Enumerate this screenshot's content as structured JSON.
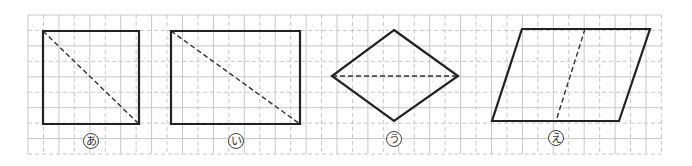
{
  "grid": {
    "x0": 28,
    "y0": 15,
    "cell": 15.45,
    "cols": 41,
    "rows": 9,
    "solid_color": "#c8c8c8",
    "dashed_color": "#c8c8c8",
    "pattern": "alternating solid/dashed, starting solid"
  },
  "style": {
    "shape_stroke": "#222222",
    "shape_width": 2.2,
    "dash_stroke": "#333333",
    "dash_width": 1.4,
    "label_circle": "#444444"
  },
  "figures": [
    {
      "id": "a",
      "name": "square",
      "label": "あ",
      "outline": [
        [
          43,
          31
        ],
        [
          139,
          31
        ],
        [
          139,
          124
        ],
        [
          43,
          124
        ]
      ],
      "dashed": [
        [
          43,
          31
        ],
        [
          139,
          124
        ]
      ],
      "label_pos": [
        91,
        141
      ]
    },
    {
      "id": "i",
      "name": "rectangle",
      "label": "い",
      "outline": [
        [
          171,
          31
        ],
        [
          300,
          31
        ],
        [
          300,
          124
        ],
        [
          171,
          124
        ]
      ],
      "dashed": [
        [
          171,
          31
        ],
        [
          300,
          124
        ]
      ],
      "label_pos": [
        236,
        141
      ]
    },
    {
      "id": "u",
      "name": "rhombus",
      "label": "う",
      "outline": [
        [
          394,
          30
        ],
        [
          458,
          76
        ],
        [
          394,
          121
        ],
        [
          332,
          76
        ]
      ],
      "dashed": [
        [
          332,
          76
        ],
        [
          458,
          76
        ]
      ],
      "label_pos": [
        394,
        139
      ]
    },
    {
      "id": "e",
      "name": "parallelogram",
      "label": "え",
      "outline": [
        [
          522,
          29
        ],
        [
          650,
          29
        ],
        [
          619,
          121
        ],
        [
          492,
          121
        ]
      ],
      "dashed": [
        [
          585,
          29
        ],
        [
          556,
          121
        ]
      ],
      "label_pos": [
        556,
        138
      ]
    }
  ]
}
